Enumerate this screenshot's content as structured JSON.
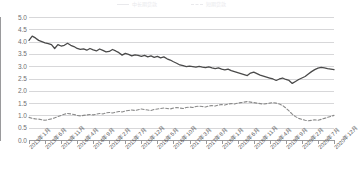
{
  "legend": {
    "items": [
      {
        "label": "中长期贷款",
        "style": "solid",
        "color": "#4a4a4a"
      },
      {
        "label": "短期贷款",
        "style": "dashed",
        "color": "#8a8a8a"
      }
    ]
  },
  "axes": {
    "y_ticks": [
      "5.0",
      "4.5",
      "4.0",
      "3.5",
      "3.0",
      "2.5",
      "2.0",
      "1.5",
      "1.0",
      "0.5",
      "0.0"
    ],
    "y_min": 0.0,
    "y_max": 5.0,
    "y_step": 0.5,
    "x_ticks": [
      "2013年1月",
      "2013年6月",
      "2013年11月",
      "2014年4月",
      "2014年9月",
      "2015年2月",
      "2015年7月",
      "2015年12月",
      "2016年5月",
      "2016年10月",
      "2017年3月",
      "2017年8月",
      "2018年1月",
      "2018年6月",
      "2018年11月",
      "2019年4月",
      "2019年9月",
      "2020年2月",
      "2020年7月",
      "2020年12月"
    ]
  },
  "chart_data": {
    "type": "line",
    "title": "",
    "subtitle": "",
    "xlabel": "",
    "ylabel": "",
    "ylim": [
      0.0,
      5.0
    ],
    "grid": true,
    "legend_position": "top-center",
    "x_labels": [
      "2013年1月",
      "2013年6月",
      "2013年11月",
      "2014年4月",
      "2014年9月",
      "2015年2月",
      "2015年7月",
      "2015年12月",
      "2016年5月",
      "2016年10月",
      "2017年3月",
      "2017年8月",
      "2018年1月",
      "2018年6月",
      "2018年11月",
      "2019年4月",
      "2019年9月",
      "2020年2月",
      "2020年7月",
      "2020年12月"
    ],
    "x_tick_interval_months": 5,
    "x_start": "2013年1月",
    "x_end": "2020年12月",
    "n_points": 96,
    "series": [
      {
        "name": "中长期贷款",
        "style": "solid",
        "color": "#4a4a4a",
        "values": [
          4.05,
          4.22,
          4.15,
          4.05,
          4.0,
          3.95,
          3.92,
          3.88,
          3.72,
          3.88,
          3.82,
          3.85,
          3.93,
          3.85,
          3.8,
          3.72,
          3.68,
          3.7,
          3.65,
          3.72,
          3.66,
          3.62,
          3.7,
          3.64,
          3.58,
          3.6,
          3.68,
          3.62,
          3.55,
          3.45,
          3.52,
          3.48,
          3.42,
          3.46,
          3.44,
          3.4,
          3.44,
          3.38,
          3.42,
          3.36,
          3.4,
          3.34,
          3.38,
          3.3,
          3.25,
          3.18,
          3.12,
          3.05,
          3.02,
          2.98,
          3.0,
          2.98,
          2.96,
          2.99,
          2.96,
          2.94,
          2.97,
          2.93,
          2.9,
          2.93,
          2.88,
          2.85,
          2.88,
          2.82,
          2.78,
          2.74,
          2.7,
          2.66,
          2.62,
          2.72,
          2.76,
          2.7,
          2.64,
          2.6,
          2.56,
          2.52,
          2.48,
          2.42,
          2.48,
          2.52,
          2.46,
          2.42,
          2.3,
          2.38,
          2.46,
          2.52,
          2.58,
          2.68,
          2.78,
          2.86,
          2.92,
          2.95,
          2.93,
          2.9,
          2.88,
          2.86
        ]
      },
      {
        "name": "短期贷款",
        "style": "dashed",
        "color": "#8a8a8a",
        "values": [
          0.92,
          0.88,
          0.86,
          0.85,
          0.82,
          0.8,
          0.83,
          0.86,
          0.9,
          0.95,
          1.0,
          1.05,
          1.08,
          1.06,
          1.04,
          1.0,
          0.98,
          1.0,
          1.02,
          1.04,
          1.02,
          1.05,
          1.08,
          1.06,
          1.1,
          1.12,
          1.1,
          1.13,
          1.16,
          1.14,
          1.18,
          1.2,
          1.22,
          1.2,
          1.23,
          1.26,
          1.24,
          1.22,
          1.2,
          1.24,
          1.26,
          1.28,
          1.3,
          1.28,
          1.26,
          1.3,
          1.32,
          1.3,
          1.28,
          1.32,
          1.34,
          1.32,
          1.36,
          1.38,
          1.36,
          1.34,
          1.38,
          1.4,
          1.38,
          1.42,
          1.44,
          1.42,
          1.46,
          1.48,
          1.46,
          1.5,
          1.52,
          1.54,
          1.56,
          1.54,
          1.52,
          1.5,
          1.48,
          1.46,
          1.48,
          1.5,
          1.52,
          1.5,
          1.46,
          1.4,
          1.3,
          1.18,
          1.05,
          0.95,
          0.88,
          0.84,
          0.8,
          0.78,
          0.8,
          0.82,
          0.8,
          0.84,
          0.88,
          0.92,
          0.96,
          1.0
        ]
      }
    ]
  }
}
